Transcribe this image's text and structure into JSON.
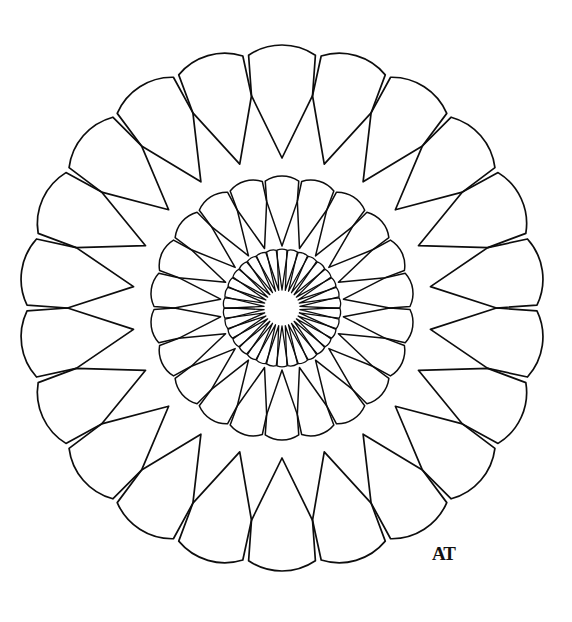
{
  "artwork": {
    "title": "Concentric Petal Mandala",
    "subject": "mandala-line-drawing",
    "style": "coloring-book outline",
    "medium": "black ink on white paper",
    "canvas": {
      "width": 572,
      "height": 622
    },
    "background_color": "#ffffff",
    "ink_color": "#0d0d0d"
  },
  "geometry": {
    "center": {
      "x": 282,
      "y": 308
    },
    "hub_radius": 18
  },
  "rings": [
    {
      "id": "outer-ring",
      "name": "outer-petal-ring",
      "petal_count": 22,
      "outer_radius": 255,
      "inner_radius": 150,
      "tip_radius": 52,
      "stroke_width": 1.7,
      "rotation_deg": -90,
      "petal_shape": "round-tip-taper",
      "half_angle_deg": 8.18
    },
    {
      "id": "middle-ring",
      "name": "middle-petal-ring",
      "petal_count": 22,
      "outer_radius": 128,
      "inner_radius": 62,
      "tip_radius": 26,
      "stroke_width": 1.5,
      "rotation_deg": -90,
      "petal_shape": "round-tip-taper",
      "half_angle_deg": 8.18
    },
    {
      "id": "inner-ring",
      "name": "inner-petal-ring",
      "petal_count": 34,
      "outer_radius": 58,
      "inner_radius": 18,
      "tip_radius": 11,
      "stroke_width": 1.3,
      "rotation_deg": -90,
      "petal_shape": "round-tip-taper",
      "half_angle_deg": 5.29
    }
  ],
  "signature": {
    "text": "AT",
    "monogram": true,
    "position": {
      "x": 432,
      "y": 543
    },
    "color": "#111111",
    "description": "handwritten artist monogram"
  }
}
